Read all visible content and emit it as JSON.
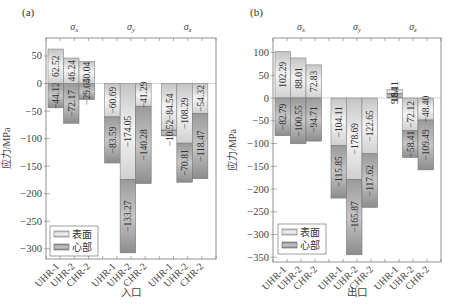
{
  "chart_data": [
    {
      "type": "bar",
      "panel_label": "(a)",
      "xlabel": "入口",
      "ylabel": "应力/MPa",
      "ylim": [
        -315,
        80
      ],
      "yticks": [
        50,
        0,
        -50,
        -100,
        -150,
        -200,
        -250,
        -300
      ],
      "groups": [
        "σx",
        "σy",
        "σz"
      ],
      "categories": [
        "UHR-1",
        "UHR-2",
        "CHR-2"
      ],
      "legend": [
        "表面",
        "心部"
      ],
      "legend_position": "lower-left",
      "series": [
        {
          "name": "表面",
          "values": {
            "σx": [
              62.52,
              46.24,
              40.04
            ],
            "σy": [
              -60.69,
              -174.05,
              -41.29
            ],
            "σz": [
              -84.54,
              -108.29,
              -54.32
            ]
          }
        },
        {
          "name": "心部",
          "values": {
            "σx": [
              -44.12,
              -72.17,
              -29.05
            ],
            "σy": [
              -83.59,
              -133.27,
              -140.28
            ],
            "σz": [
              -10.52,
              -70.81,
              -118.47
            ]
          }
        }
      ]
    },
    {
      "type": "bar",
      "panel_label": "(b)",
      "xlabel": "出口",
      "ylabel": "应力/MPa",
      "ylim": [
        -360,
        120
      ],
      "yticks": [
        100,
        50,
        0,
        -50,
        -100,
        -150,
        -200,
        -250,
        -300,
        -350
      ],
      "groups": [
        "σx",
        "σy",
        "σz"
      ],
      "categories": [
        "UHR-1",
        "UHR-2",
        "CHR-2"
      ],
      "legend": [
        "表面",
        "心部"
      ],
      "legend_position": "lower-left",
      "series": [
        {
          "name": "表面",
          "values": {
            "σx": [
              102.29,
              88.01,
              72.83
            ],
            "σy": [
              -104.11,
              -178.69,
              -122.65
            ],
            "σz": [
              18.11,
              -72.12,
              -48.4
            ]
          }
        },
        {
          "name": "心部",
          "values": {
            "σx": [
              -82.79,
              -100.55,
              -94.71
            ],
            "σy": [
              -115.85,
              -165.87,
              -117.62
            ],
            "σz": [
              9.64,
              -58.41,
              -109.49
            ]
          }
        }
      ]
    }
  ],
  "panels": [
    {
      "label": "(a)",
      "xlabel": "入口",
      "ylabel": "应力/MPa",
      "group_titles": [
        "σx",
        "σy",
        "σz"
      ],
      "yticks": [
        "50",
        "0",
        "−50",
        "−100",
        "−150",
        "−200",
        "−250",
        "−300"
      ],
      "legend": {
        "surface": "表面",
        "core": "心部"
      },
      "xticks": [
        "UHR-1",
        "UHR-2",
        "CHR-2",
        "UHR-1",
        "UHR-2",
        "CHR-2",
        "UHR-1",
        "UHR-2",
        "CHR-2"
      ]
    },
    {
      "label": "(b)",
      "xlabel": "出口",
      "ylabel": "应力/MPa",
      "group_titles": [
        "σx",
        "σy",
        "σz"
      ],
      "yticks": [
        "100",
        "50",
        "0",
        "−50",
        "−100",
        "−150",
        "−200",
        "−250",
        "−300",
        "−350"
      ],
      "legend": {
        "surface": "表面",
        "core": "心部"
      },
      "xticks": [
        "UHR-1",
        "UHR-2",
        "CHR-2",
        "UHR-1",
        "UHR-2",
        "CHR-2",
        "UHR-1",
        "UHR-2",
        "CHR-2"
      ]
    }
  ],
  "colors": {
    "surface_light": "#f2f2f2",
    "surface_dark": "#c8c8c8",
    "core_light": "#bdbdbd",
    "core_dark": "#8a8a8a",
    "axis": "#666666",
    "text": "#333333"
  }
}
